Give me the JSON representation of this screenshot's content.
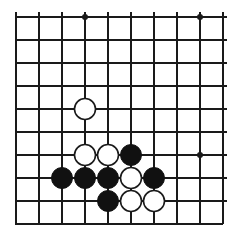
{
  "figure": {
    "kind": "go-board-diagram",
    "background_color": "#ffffff",
    "line_color": "#1a1a1a",
    "black_stone_color": "#111111",
    "white_stone_fill": "#ffffff",
    "white_stone_outline": "#1a1a1a"
  },
  "board": {
    "origin_x": 16,
    "origin_y": 17,
    "cell": 23,
    "cols": 9,
    "rows": 10,
    "thin_line_width": 1.1,
    "thick_edge_width": 2.2,
    "edges": {
      "left_thick": true,
      "top_thick": true,
      "right_thick": false,
      "bottom_thick": true
    }
  },
  "star_points": [
    {
      "col": 3,
      "row": 0,
      "radius": 3.0
    },
    {
      "col": 8,
      "row": 0,
      "radius": 3.0
    },
    {
      "col": 8,
      "row": 6,
      "radius": 3.0
    }
  ],
  "stones": {
    "radius": 10.5,
    "outline_width": 1.6,
    "list": [
      {
        "col": 3,
        "row": 4,
        "color": "white"
      },
      {
        "col": 3,
        "row": 6,
        "color": "white"
      },
      {
        "col": 4,
        "row": 6,
        "color": "white"
      },
      {
        "col": 5,
        "row": 6,
        "color": "black"
      },
      {
        "col": 2,
        "row": 7,
        "color": "black"
      },
      {
        "col": 3,
        "row": 7,
        "color": "black"
      },
      {
        "col": 4,
        "row": 7,
        "color": "black"
      },
      {
        "col": 5,
        "row": 7,
        "color": "white"
      },
      {
        "col": 6,
        "row": 7,
        "color": "black"
      },
      {
        "col": 4,
        "row": 8,
        "color": "black"
      },
      {
        "col": 5,
        "row": 8,
        "color": "white"
      },
      {
        "col": 6,
        "row": 8,
        "color": "white"
      }
    ]
  },
  "counts": {
    "black_stones": 7,
    "white_stones": 5,
    "total_stones": 12
  }
}
